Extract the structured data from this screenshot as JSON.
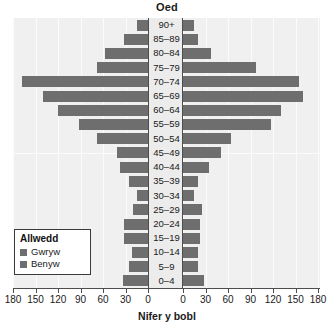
{
  "chart": {
    "top_axis_title": "Oed",
    "bottom_axis_title": "Nifer y bobl"
  },
  "legend": {
    "title": "Allwedd",
    "items": [
      {
        "label": "Gwryw",
        "color": "#6e6e6e"
      },
      {
        "label": "Benyw",
        "color": "#6e6e6e"
      }
    ]
  },
  "ticks": {
    "labels": [
      "180",
      "150",
      "120",
      "90",
      "60",
      "30",
      "0",
      "0",
      "30",
      "60",
      "90",
      "120",
      "150",
      "180"
    ]
  },
  "chart_data": {
    "type": "bar",
    "subtype": "population-pyramid",
    "title": "Oed",
    "xlabel": "Nifer y bobl",
    "ylabel": "Oed",
    "grid": true,
    "legend_position": "bottom-left",
    "xlim_left": [
      180,
      0
    ],
    "xlim_right": [
      0,
      180
    ],
    "xticks": [
      0,
      30,
      60,
      90,
      120,
      150,
      180
    ],
    "categories": [
      "0–4",
      "5–9",
      "10–14",
      "15–19",
      "20–24",
      "25–29",
      "30–34",
      "35–39",
      "40–44",
      "45–49",
      "50–54",
      "55–59",
      "60–64",
      "65–69",
      "70–74",
      "75–79",
      "80–84",
      "85–89",
      "90+"
    ],
    "series": [
      {
        "name": "Gwryw",
        "side": "left",
        "color": "#6e6e6e",
        "values": [
          33,
          25,
          22,
          32,
          32,
          20,
          15,
          25,
          37,
          42,
          68,
          92,
          120,
          140,
          168,
          68,
          58,
          32,
          15
        ]
      },
      {
        "name": "Benyw",
        "side": "right",
        "color": "#6e6e6e",
        "values": [
          28,
          20,
          20,
          22,
          22,
          25,
          14,
          20,
          34,
          50,
          64,
          117,
          130,
          160,
          155,
          97,
          37,
          20,
          14
        ]
      }
    ]
  }
}
